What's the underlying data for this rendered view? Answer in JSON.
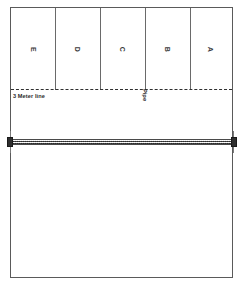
{
  "diagram": {
    "court": {
      "outline_color": "#5a5a5a",
      "background_color": "#ffffff"
    },
    "zones": [
      {
        "label": "E"
      },
      {
        "label": "D"
      },
      {
        "label": "C"
      },
      {
        "label": "B"
      },
      {
        "label": "A"
      }
    ],
    "lines": {
      "attack_line_label": "3 Meter line",
      "attack_line_style": "dashed",
      "attack_line_color": "#2f2f2f"
    },
    "annotations": {
      "pipe_label": "Pipe"
    },
    "net": {
      "style": "hatched",
      "fill_color": "#bdbdbd",
      "post_color": "#2e2e2e"
    }
  }
}
